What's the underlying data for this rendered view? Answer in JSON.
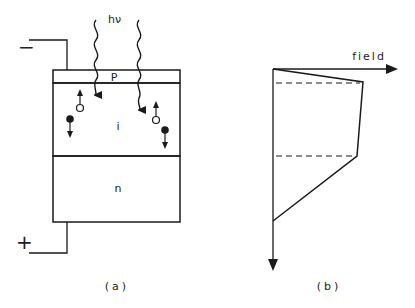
{
  "panel_a": {
    "caption": "(a)",
    "photon_label": "hν",
    "terminal_negative": "−",
    "terminal_positive": "+",
    "layers": {
      "p": "P",
      "i": "i",
      "n": "n"
    }
  },
  "panel_b": {
    "caption": "(b)",
    "axis_label": "field"
  },
  "colors": {
    "line": "#1a1a1a",
    "background": "#ffffff"
  }
}
